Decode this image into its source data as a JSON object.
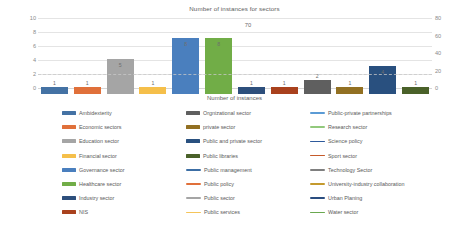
{
  "chart_data": {
    "type": "bar",
    "title": "Number of instances for sectors",
    "xlabel": "Number of instances",
    "ylabel": "",
    "ylim": [
      0,
      10
    ],
    "y2lim": [
      0,
      80
    ],
    "grid": true,
    "legend_position": "bottom",
    "left_ticks": [
      "10",
      "8",
      "6",
      "4",
      "2",
      "0"
    ],
    "right_ticks": [
      "80",
      "60",
      "40",
      "20",
      "0"
    ],
    "annotations": [
      {
        "text": "70",
        "x_pct": 52.5,
        "y_value": 8.9
      }
    ],
    "categories": [
      "Ambidexterity",
      "Economic sectors",
      "Education sector",
      "Financial sector",
      "Governance sector",
      "Healthcare sector",
      "Industry sector",
      "NIS",
      "Orgnizational  sector",
      "private sector",
      "Public and private sector",
      "Public libraries"
    ],
    "values": [
      1,
      1,
      5,
      1,
      8,
      8,
      1,
      1,
      2,
      1,
      4,
      1
    ],
    "colors": [
      "#4472a4",
      "#e0703a",
      "#a5a5a5",
      "#f5bf4a",
      "#4a7fbe",
      "#71ad47",
      "#2d4f7c",
      "#a9411d",
      "#5f5f5f",
      "#927022",
      "#29507f",
      "#4a6129"
    ]
  },
  "legend": {
    "entries": [
      {
        "label": "Ambidexterity",
        "color": "#4472a4",
        "style": "bar"
      },
      {
        "label": "Economic sectors",
        "color": "#e0703a",
        "style": "bar"
      },
      {
        "label": "Education sector",
        "color": "#a5a5a5",
        "style": "bar"
      },
      {
        "label": "Financial sector",
        "color": "#f5bf4a",
        "style": "bar"
      },
      {
        "label": "Governance sector",
        "color": "#4a7fbe",
        "style": "bar"
      },
      {
        "label": "Healthcare sector",
        "color": "#71ad47",
        "style": "bar"
      },
      {
        "label": "Industry sector",
        "color": "#2d4f7c",
        "style": "bar"
      },
      {
        "label": "NIS",
        "color": "#a9411d",
        "style": "bar"
      },
      {
        "label": "Orgnizational  sector",
        "color": "#5f5f5f",
        "style": "bar"
      },
      {
        "label": "private sector",
        "color": "#927022",
        "style": "bar"
      },
      {
        "label": "Public and private sector",
        "color": "#29507f",
        "style": "bar"
      },
      {
        "label": "Public libraries",
        "color": "#4a6129",
        "style": "bar"
      },
      {
        "label": "Public management",
        "color": "#3c6ea5",
        "style": "line"
      },
      {
        "label": "Public policy",
        "color": "#e0703a",
        "style": "line"
      },
      {
        "label": "Public sector",
        "color": "#a5a5a5",
        "style": "line"
      },
      {
        "label": "Public services",
        "color": "#f5c55a",
        "style": "line"
      },
      {
        "label": "Public-private partnerships",
        "color": "#5b9bd5",
        "style": "line"
      },
      {
        "label": "Research sector",
        "color": "#92c97c",
        "style": "line"
      },
      {
        "label": "Science policy",
        "color": "#2e5a9c",
        "style": "line"
      },
      {
        "label": "Sport sector",
        "color": "#c55a2a",
        "style": "line"
      },
      {
        "label": "Technology Sector",
        "color": "#7f7f7f",
        "style": "line"
      },
      {
        "label": "University-industry collaboration",
        "color": "#c49a2e",
        "style": "line"
      },
      {
        "label": "Urban Planing",
        "color": "#2a4d80",
        "style": "line"
      },
      {
        "label": "Water sector",
        "color": "#6aa84f",
        "style": "line"
      }
    ]
  }
}
